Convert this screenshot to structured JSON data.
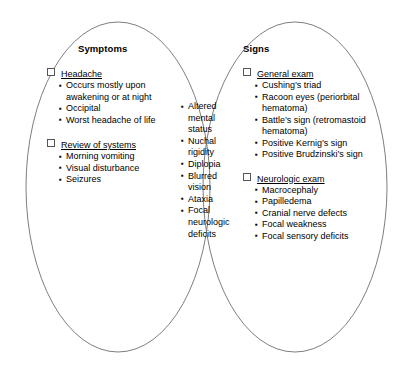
{
  "diagram": {
    "type": "venn-two-set",
    "stroke_color": "#6f6f6f",
    "background_color": "#ffffff",
    "left_circle": {
      "title": "Symptoms",
      "groups": [
        {
          "label": "Headache",
          "items": [
            "Occurs mostly upon awakening or at night",
            "Occipital",
            "Worst headache of life"
          ]
        },
        {
          "label": "Review of systems",
          "items": [
            "Morning vomiting",
            "Visual disturbance",
            "Seizures"
          ]
        }
      ]
    },
    "overlap": {
      "items": [
        "Altered mental status",
        "Nuchal rigidity",
        "Diplopia",
        "Blurred vision",
        "Ataxia",
        "Focal neurologic deficits"
      ]
    },
    "right_circle": {
      "title": "Signs",
      "groups": [
        {
          "label": "General exam",
          "items": [
            "Cushing’s triad",
            "Racoon eyes (periorbital hematoma)",
            "Battle’s sign (retromastoid hematoma)",
            "Positive Kernig’s sign",
            "Positive Brudzinski’s sign"
          ]
        },
        {
          "label": "Neurologic exam",
          "items": [
            "Macrocephaly",
            "Papilledema",
            "Cranial nerve defects",
            "Focal weakness",
            "Focal sensory deficits"
          ]
        }
      ]
    }
  }
}
